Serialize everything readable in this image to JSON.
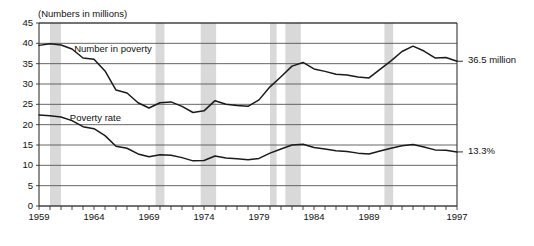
{
  "chart_data": {
    "type": "line",
    "title": "",
    "subtitle": "(Numbers in millions)",
    "xlabel": "",
    "ylabel": "",
    "ylim": [
      0,
      45
    ],
    "ytick_step": 5,
    "yticks": [
      "45",
      "40",
      "35",
      "30",
      "25",
      "20",
      "15",
      "10",
      "5",
      "0"
    ],
    "xlim": [
      1959,
      1997
    ],
    "xticks_labeled": [
      "1959",
      "1964",
      "1969",
      "1974",
      "1979",
      "1984",
      "1989",
      "1997"
    ],
    "xtick_years": [
      1959,
      1964,
      1969,
      1974,
      1979,
      1984,
      1989,
      1997
    ],
    "grid": true,
    "legend_position": "inline-annotations",
    "x": [
      1959,
      1960,
      1961,
      1962,
      1963,
      1964,
      1965,
      1966,
      1967,
      1968,
      1969,
      1970,
      1971,
      1972,
      1973,
      1974,
      1975,
      1976,
      1977,
      1978,
      1979,
      1980,
      1981,
      1982,
      1983,
      1984,
      1985,
      1986,
      1987,
      1988,
      1989,
      1990,
      1991,
      1992,
      1993,
      1994,
      1995,
      1996,
      1997
    ],
    "series": [
      {
        "name": "Number in poverty",
        "units": "millions",
        "label_x": 1962.2,
        "label_y": 38.6,
        "end_annotation": "36.5 million",
        "values": [
          39.5,
          39.9,
          39.6,
          38.6,
          36.4,
          36.1,
          33.2,
          28.5,
          27.8,
          25.4,
          24.1,
          25.4,
          25.6,
          24.5,
          23.0,
          23.4,
          25.9,
          25.0,
          24.7,
          24.5,
          26.1,
          29.3,
          31.8,
          34.4,
          35.3,
          33.7,
          33.1,
          32.4,
          32.2,
          31.7,
          31.5,
          33.6,
          35.7,
          38.0,
          39.3,
          38.1,
          36.4,
          36.5,
          35.6
        ]
      },
      {
        "name": "Poverty rate",
        "units": "percent",
        "label_x": 1961.8,
        "label_y": 21.6,
        "end_annotation": "13.3%",
        "values": [
          22.4,
          22.2,
          21.9,
          21.0,
          19.5,
          19.0,
          17.3,
          14.7,
          14.2,
          12.8,
          12.1,
          12.6,
          12.5,
          11.9,
          11.1,
          11.2,
          12.3,
          11.8,
          11.6,
          11.4,
          11.7,
          13.0,
          14.0,
          15.0,
          15.2,
          14.4,
          14.0,
          13.6,
          13.4,
          13.0,
          12.8,
          13.5,
          14.2,
          14.8,
          15.1,
          14.5,
          13.8,
          13.7,
          13.3
        ]
      }
    ],
    "recession_bands": [
      {
        "start": 1960.0,
        "end": 1961.0
      },
      {
        "start": 1969.6,
        "end": 1970.4
      },
      {
        "start": 1973.7,
        "end": 1975.1
      },
      {
        "start": 1980.0,
        "end": 1980.6
      },
      {
        "start": 1981.4,
        "end": 1982.8
      },
      {
        "start": 1990.4,
        "end": 1991.2
      }
    ],
    "recession_band_color": "#d9d9d9",
    "line_color": "#1a1a1a",
    "grid_color": "#555555",
    "axis_color": "#333333"
  }
}
